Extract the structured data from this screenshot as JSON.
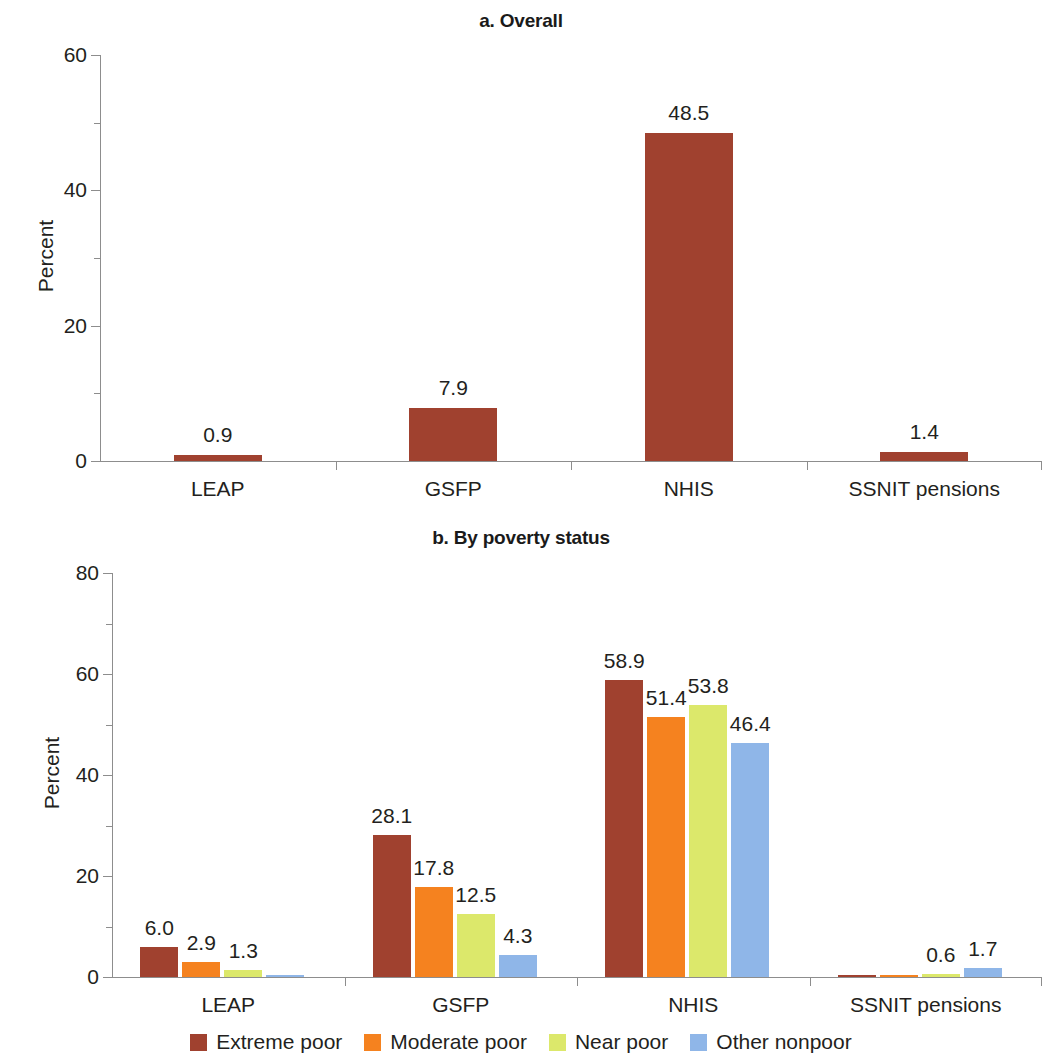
{
  "figure": {
    "y_axis_title": "Percent"
  },
  "panels": [
    {
      "id": "a",
      "title": "a. Overall",
      "ylabel": "Percent",
      "ylim": [
        0,
        60
      ],
      "yticks": [
        0,
        20,
        40,
        60
      ],
      "yticklabels": [
        "0",
        "20",
        "40",
        "60"
      ],
      "categories": [
        "LEAP",
        "GSFP",
        "NHIS",
        "SSNIT pensions"
      ],
      "values": [
        0.9,
        7.9,
        48.5,
        1.4
      ],
      "labels": [
        "0.9",
        "7.9",
        "48.5",
        "1.4"
      ]
    },
    {
      "id": "b",
      "title": "b. By poverty status",
      "ylabel": "Percent",
      "ylim": [
        0,
        80
      ],
      "yticks": [
        0,
        20,
        40,
        60,
        80
      ],
      "yticklabels": [
        "0",
        "20",
        "40",
        "60",
        "80"
      ],
      "categories": [
        "LEAP",
        "GSFP",
        "NHIS",
        "SSNIT pensions"
      ],
      "series": [
        {
          "name": "Extreme poor",
          "values": [
            6.0,
            28.1,
            58.9,
            0.1
          ],
          "labels": [
            "6.0",
            "28.1",
            "58.9",
            ""
          ]
        },
        {
          "name": "Moderate poor",
          "values": [
            2.9,
            17.8,
            51.4,
            0.2
          ],
          "labels": [
            "2.9",
            "17.8",
            "51.4",
            ""
          ]
        },
        {
          "name": "Near poor",
          "values": [
            1.3,
            12.5,
            53.8,
            0.6
          ],
          "labels": [
            "1.3",
            "12.5",
            "53.8",
            "0.6"
          ]
        },
        {
          "name": "Other nonpoor",
          "values": [
            0.2,
            4.3,
            46.4,
            1.7
          ],
          "labels": [
            "",
            "4.3",
            "46.4",
            "1.7"
          ]
        }
      ]
    }
  ],
  "legend": {
    "position": "bottom",
    "items": [
      {
        "label": "Extreme poor",
        "color": "#A0412F"
      },
      {
        "label": "Moderate poor",
        "color": "#F5821F"
      },
      {
        "label": "Near poor",
        "color": "#DCE86B"
      },
      {
        "label": "Other nonpoor",
        "color": "#8FB6E8"
      }
    ]
  },
  "colors": {
    "extreme_poor": "#A0412F",
    "moderate_poor": "#F5821F",
    "near_poor": "#DCE86B",
    "other_nonpoor": "#8FB6E8",
    "axis": "#8d8d8d",
    "text": "#231f20"
  },
  "chart_data": [
    {
      "type": "bar",
      "title": "a. Overall",
      "xlabel": "",
      "ylabel": "Percent",
      "ylim": [
        0,
        60
      ],
      "yticks": [
        0,
        20,
        40,
        60
      ],
      "grid": false,
      "legend": null,
      "categories": [
        "LEAP",
        "GSFP",
        "NHIS",
        "SSNIT pensions"
      ],
      "values": [
        0.9,
        7.9,
        48.5,
        1.4
      ],
      "data_labels": [
        "0.9",
        "7.9",
        "48.5",
        "1.4"
      ],
      "bar_color": "#A0412F"
    },
    {
      "type": "bar",
      "title": "b. By poverty status",
      "xlabel": "",
      "ylabel": "Percent",
      "ylim": [
        0,
        80
      ],
      "yticks": [
        0,
        20,
        40,
        60,
        80
      ],
      "grid": false,
      "legend": "bottom",
      "categories": [
        "LEAP",
        "GSFP",
        "NHIS",
        "SSNIT pensions"
      ],
      "series": [
        {
          "name": "Extreme poor",
          "color": "#A0412F",
          "values": [
            6.0,
            28.1,
            58.9,
            0.1
          ],
          "data_labels": [
            "6.0",
            "28.1",
            "58.9",
            ""
          ]
        },
        {
          "name": "Moderate poor",
          "color": "#F5821F",
          "values": [
            2.9,
            17.8,
            51.4,
            0.2
          ],
          "data_labels": [
            "2.9",
            "17.8",
            "51.4",
            ""
          ]
        },
        {
          "name": "Near poor",
          "color": "#DCE86B",
          "values": [
            1.3,
            12.5,
            53.8,
            0.6
          ],
          "data_labels": [
            "1.3",
            "12.5",
            "53.8",
            "0.6"
          ]
        },
        {
          "name": "Other nonpoor",
          "color": "#8FB6E8",
          "values": [
            0.2,
            4.3,
            46.4,
            1.7
          ],
          "data_labels": [
            "",
            "4.3",
            "46.4",
            "1.7"
          ]
        }
      ]
    }
  ]
}
